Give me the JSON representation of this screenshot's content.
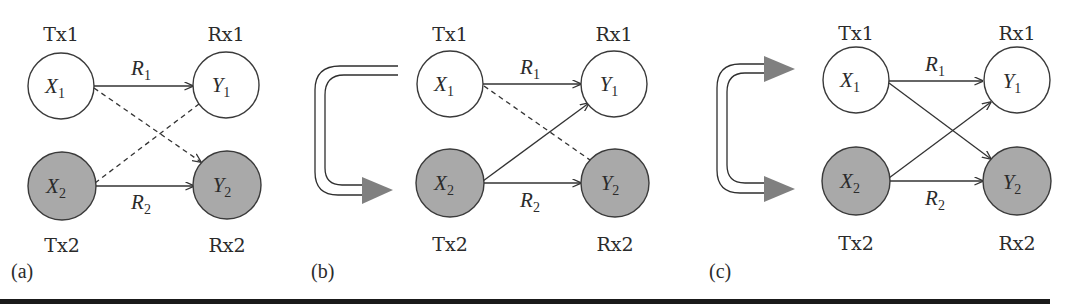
{
  "figure": {
    "panels": [
      {
        "id": "a",
        "label": "(a)",
        "tx1": "Tx1",
        "rx1": "Rx1",
        "tx2": "Tx2",
        "rx2": "Rx2",
        "x1": {
          "var": "X",
          "sub": "1"
        },
        "y1": {
          "var": "Y",
          "sub": "1"
        },
        "x2": {
          "var": "X",
          "sub": "2"
        },
        "y2": {
          "var": "Y",
          "sub": "2"
        },
        "r1": {
          "var": "R",
          "sub": "1"
        },
        "r2": {
          "var": "R",
          "sub": "2"
        },
        "links": [
          {
            "from": "X1",
            "to": "Y1",
            "style": "solid",
            "label": "R1"
          },
          {
            "from": "X2",
            "to": "Y2",
            "style": "solid",
            "label": "R2"
          },
          {
            "from": "X1",
            "to": "Y2",
            "style": "dashed"
          },
          {
            "from": "X2",
            "to": "Y1",
            "style": "dashed"
          }
        ],
        "cooperation": "none"
      },
      {
        "id": "b",
        "label": "(b)",
        "tx1": "Tx1",
        "rx1": "Rx1",
        "tx2": "Tx2",
        "rx2": "Rx2",
        "x1": {
          "var": "X",
          "sub": "1"
        },
        "y1": {
          "var": "Y",
          "sub": "1"
        },
        "x2": {
          "var": "X",
          "sub": "2"
        },
        "y2": {
          "var": "Y",
          "sub": "2"
        },
        "r1": {
          "var": "R",
          "sub": "1"
        },
        "r2": {
          "var": "R",
          "sub": "2"
        },
        "links": [
          {
            "from": "X1",
            "to": "Y1",
            "style": "solid",
            "label": "R1"
          },
          {
            "from": "X2",
            "to": "Y2",
            "style": "solid",
            "label": "R2"
          },
          {
            "from": "X1",
            "to": "Y2",
            "style": "dashed"
          },
          {
            "from": "X2",
            "to": "Y1",
            "style": "solid"
          }
        ],
        "cooperation": "Tx1 to Tx2 (one-way)"
      },
      {
        "id": "c",
        "label": "(c)",
        "tx1": "Tx1",
        "rx1": "Rx1",
        "tx2": "Tx2",
        "rx2": "Rx2",
        "x1": {
          "var": "X",
          "sub": "1"
        },
        "y1": {
          "var": "Y",
          "sub": "1"
        },
        "x2": {
          "var": "X",
          "sub": "2"
        },
        "y2": {
          "var": "Y",
          "sub": "2"
        },
        "r1": {
          "var": "R",
          "sub": "1"
        },
        "r2": {
          "var": "R",
          "sub": "2"
        },
        "links": [
          {
            "from": "X1",
            "to": "Y1",
            "style": "solid",
            "label": "R1"
          },
          {
            "from": "X2",
            "to": "Y2",
            "style": "solid",
            "label": "R2"
          },
          {
            "from": "X1",
            "to": "Y2",
            "style": "solid"
          },
          {
            "from": "X2",
            "to": "Y1",
            "style": "solid"
          }
        ],
        "cooperation": "Tx1 and Tx2 (two-way)"
      }
    ],
    "colors": {
      "primary_node_fill": "#ffffff",
      "secondary_node_fill": "#a9a9a9",
      "arrowhead_fill": "#808080",
      "stroke": "#333333"
    }
  }
}
